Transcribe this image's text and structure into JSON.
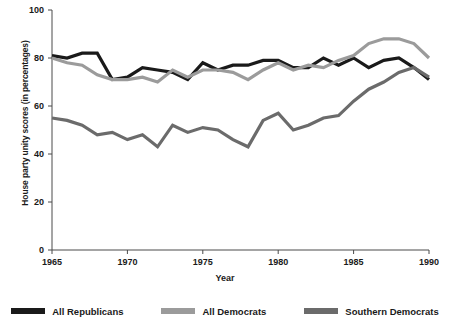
{
  "chart_data": {
    "type": "line",
    "title": "",
    "xlabel": "Year",
    "ylabel": "House party unity scores (in percentages)",
    "xlim": [
      1965,
      1990
    ],
    "ylim": [
      0,
      100
    ],
    "grid": false,
    "legend_position": "bottom",
    "x": [
      1965,
      1966,
      1967,
      1968,
      1969,
      1970,
      1971,
      1972,
      1973,
      1974,
      1975,
      1976,
      1977,
      1978,
      1979,
      1980,
      1981,
      1982,
      1983,
      1984,
      1985,
      1986,
      1987,
      1988,
      1989,
      1990
    ],
    "xticks": [
      1965,
      1970,
      1975,
      1980,
      1985,
      1990
    ],
    "xtick_labels": [
      "1965",
      "1970",
      "1975",
      "1980",
      "1985",
      "1990"
    ],
    "yticks": [
      0,
      20,
      40,
      60,
      80,
      100
    ],
    "ytick_labels": [
      "0",
      "20",
      "40",
      "60",
      "80",
      "100"
    ],
    "series": [
      {
        "name": "All Republicans",
        "color": "#1a1a1a",
        "values": [
          81,
          80,
          82,
          82,
          71,
          72,
          76,
          75,
          74,
          71,
          78,
          75,
          77,
          77,
          79,
          79,
          76,
          76,
          80,
          77,
          80,
          76,
          79,
          80,
          76,
          71
        ]
      },
      {
        "name": "All Democrats",
        "color": "#9b9b9b",
        "values": [
          80,
          78,
          77,
          73,
          71,
          71,
          72,
          70,
          75,
          72,
          75,
          75,
          74,
          71,
          75,
          78,
          75,
          77,
          76,
          79,
          81,
          86,
          88,
          88,
          86,
          80
        ]
      },
      {
        "name": "Southern Democrats",
        "color": "#6b6b6b",
        "values": [
          55,
          54,
          52,
          48,
          49,
          46,
          48,
          43,
          52,
          49,
          51,
          50,
          46,
          43,
          54,
          57,
          50,
          52,
          55,
          56,
          62,
          67,
          70,
          74,
          76,
          72
        ]
      }
    ]
  },
  "legend": {
    "items": [
      {
        "label": "All Republicans"
      },
      {
        "label": "All Democrats"
      },
      {
        "label": "Southern Democrats"
      }
    ]
  },
  "axis": {
    "x_title": "Year",
    "y_title": "House party unity scores (in percentages)"
  }
}
